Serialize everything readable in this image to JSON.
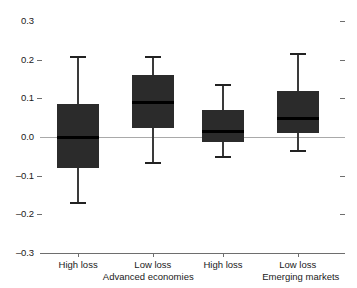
{
  "chart_data": {
    "type": "box",
    "title": "",
    "subtitle": "",
    "xlabel": "",
    "ylabel": "",
    "ylim": [
      -0.3,
      0.3
    ],
    "grid": false,
    "legend": "none",
    "zero_reference_line": true,
    "y_ticks": [
      {
        "label": "0.3",
        "value": 0.3
      },
      {
        "label": "0.2",
        "value": 0.2
      },
      {
        "label": "0.1",
        "value": 0.1
      },
      {
        "label": "0.0",
        "value": 0.0
      },
      {
        "label": "–0.1",
        "value": -0.1
      },
      {
        "label": "–0.2",
        "value": -0.2
      },
      {
        "label": "–0.3",
        "value": -0.3
      }
    ],
    "groups": [
      {
        "label": "Advanced economies",
        "center": 0.355
      },
      {
        "label": "Emerging markets",
        "center": 0.855
      }
    ],
    "categories": [
      "High loss",
      "Low loss",
      "High loss",
      "Low loss"
    ],
    "boxes": [
      {
        "name": "High loss",
        "group": "Advanced economies",
        "whisker_low": -0.173,
        "q1": -0.08,
        "median": 0.0,
        "q3": 0.085,
        "whisker_high": 0.209
      },
      {
        "name": "Low loss",
        "group": "Advanced economies",
        "whisker_low": -0.07,
        "q1": 0.023,
        "median": 0.09,
        "q3": 0.16,
        "whisker_high": 0.209
      },
      {
        "name": "High loss",
        "group": "Emerging markets",
        "whisker_low": -0.054,
        "q1": -0.013,
        "median": 0.013,
        "q3": 0.07,
        "whisker_high": 0.137
      },
      {
        "name": "Low loss",
        "group": "Emerging markets",
        "whisker_low": -0.039,
        "q1": 0.01,
        "median": 0.047,
        "q3": 0.119,
        "whisker_high": 0.217
      }
    ],
    "colors": {
      "box_fill": "#2b2b2b",
      "median": "#000000",
      "whisker": "#3a3a3a",
      "axis": "#6e6e6e",
      "zero_line": "#a9a9a9",
      "background": "#ffffff",
      "text": "#1a1a1a"
    }
  }
}
